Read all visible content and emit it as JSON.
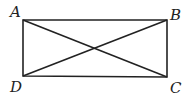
{
  "diagram": {
    "type": "rectangle-with-diagonals",
    "stroke_color": "#222222",
    "background": "#ffffff",
    "vertices": [
      {
        "label": "A",
        "x": 23,
        "y": 20,
        "label_x": 10,
        "label_y": 17
      },
      {
        "label": "B",
        "x": 167,
        "y": 20,
        "label_x": 170,
        "label_y": 20
      },
      {
        "label": "C",
        "x": 167,
        "y": 77,
        "label_x": 170,
        "label_y": 93
      },
      {
        "label": "D",
        "x": 23,
        "y": 76,
        "label_x": 10,
        "label_y": 92
      }
    ],
    "edges": [
      "AB",
      "BC",
      "CD",
      "DA",
      "AC",
      "BD"
    ]
  }
}
